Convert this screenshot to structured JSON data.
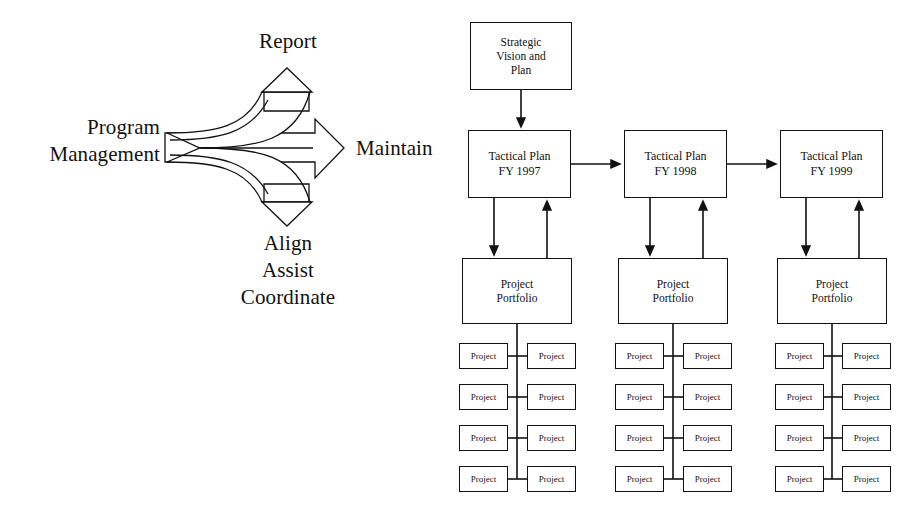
{
  "figure": {
    "left_panel": {
      "source_label_line1": "Program",
      "source_label_line2": "Management",
      "branch_up_label": "Report",
      "forward_label": "Maintain",
      "branch_down_label_line1": "Align",
      "branch_down_label_line2": "Assist",
      "branch_down_label_line3": "Coordinate"
    },
    "right_panel": {
      "strategic": {
        "line1": "Strategic",
        "line2": "Vision and",
        "line3": "Plan"
      },
      "tactical_plans": [
        {
          "line1": "Tactical Plan",
          "line2": "FY 1997"
        },
        {
          "line1": "Tactical Plan",
          "line2": "FY 1998"
        },
        {
          "line1": "Tactical Plan",
          "line2": "FY 1999"
        }
      ],
      "portfolios": [
        {
          "line1": "Project",
          "line2": "Portfolio"
        },
        {
          "line1": "Project",
          "line2": "Portfolio"
        },
        {
          "line1": "Project",
          "line2": "Portfolio"
        }
      ],
      "project_label": "Project",
      "project_rows_per_column": 4,
      "project_columns": 3,
      "projects_per_row": 2
    },
    "colors": {
      "ink": "#111111",
      "paper": "#ffffff"
    }
  }
}
